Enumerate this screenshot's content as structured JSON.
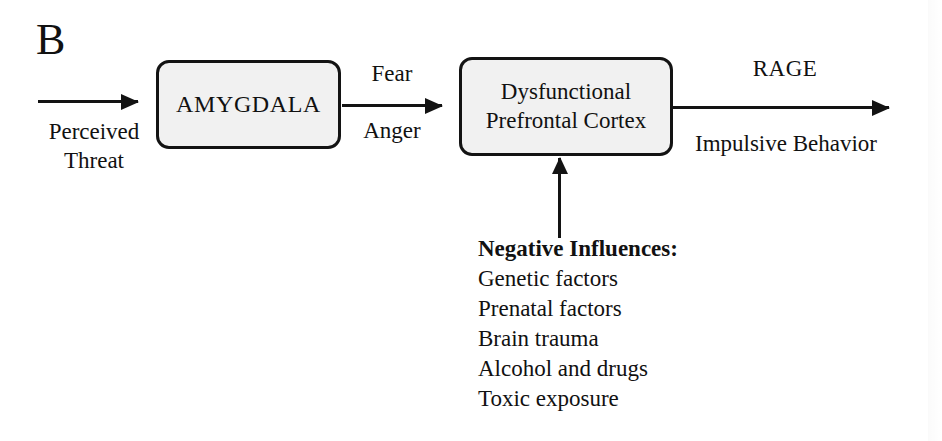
{
  "figure": {
    "panel_letter": "B"
  },
  "nodes": [
    {
      "id": "amygdala",
      "label": "AMYGDALA"
    },
    {
      "id": "prefrontal_cortex",
      "line1": "Dysfunctional",
      "line2": "Prefrontal Cortex"
    }
  ],
  "edges": {
    "input": {
      "label_line1": "Perceived",
      "label_line2": "Threat"
    },
    "amygdala_to_pfc": {
      "label_above": "Fear",
      "label_below": "Anger"
    },
    "output": {
      "label_above": "RAGE",
      "label_below": "Impulsive Behavior"
    }
  },
  "influences": {
    "heading": "Negative Influences:",
    "items": [
      "Genetic factors",
      "Prenatal factors",
      "Brain trauma",
      "Alcohol and drugs",
      "Toxic exposure"
    ]
  },
  "style": {
    "ink": "#131313",
    "box_fill": "#f1f1f1",
    "background": "#ffffff"
  }
}
